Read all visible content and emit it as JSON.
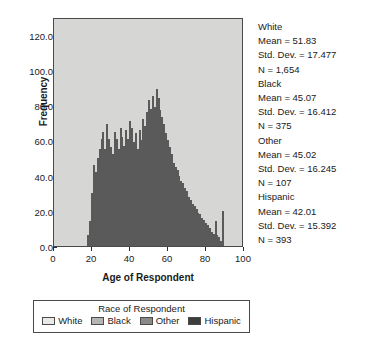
{
  "chart_data": {
    "type": "bar",
    "title": "",
    "xlabel": "Age of Respondent",
    "ylabel": "Frequency",
    "xlim": [
      0,
      100
    ],
    "ylim": [
      0,
      130
    ],
    "grid": false,
    "stacked": true,
    "legend_position": "bottom",
    "legend_title": "Race of Respondent",
    "xticks": [
      0,
      20,
      40,
      60,
      80,
      100
    ],
    "xtick_labels": [
      "0",
      "20",
      "40",
      "60",
      "80",
      "100"
    ],
    "yticks": [
      0,
      20,
      40,
      60,
      80,
      100,
      120
    ],
    "ytick_labels": [
      "0.0",
      "20.0",
      "40.0",
      "60.0",
      "80.0",
      "100.0",
      "120.0"
    ],
    "categories": [
      18,
      19,
      20,
      21,
      22,
      23,
      24,
      25,
      26,
      27,
      28,
      29,
      30,
      31,
      32,
      33,
      34,
      35,
      36,
      37,
      38,
      39,
      40,
      41,
      42,
      43,
      44,
      45,
      46,
      47,
      48,
      49,
      50,
      51,
      52,
      53,
      54,
      55,
      56,
      57,
      58,
      59,
      60,
      61,
      62,
      63,
      64,
      65,
      66,
      67,
      68,
      69,
      70,
      71,
      72,
      73,
      74,
      75,
      76,
      77,
      78,
      79,
      80,
      81,
      82,
      83,
      84,
      85,
      86,
      87,
      88,
      89
    ],
    "series": [
      {
        "name": "White",
        "color": "#e8e8e6",
        "values": [
          2,
          6,
          14,
          22,
          20,
          24,
          26,
          30,
          32,
          27,
          34,
          30,
          28,
          26,
          32,
          30,
          27,
          34,
          31,
          29,
          33,
          30,
          36,
          34,
          30,
          32,
          28,
          34,
          31,
          38,
          36,
          40,
          44,
          42,
          46,
          43,
          48,
          45,
          42,
          40,
          38,
          36,
          34,
          32,
          30,
          28,
          27,
          26,
          24,
          23,
          22,
          21,
          20,
          18,
          17,
          16,
          15,
          14,
          13,
          12,
          11,
          10,
          9,
          8,
          7,
          6,
          5,
          9,
          4,
          3,
          2,
          14
        ]
      },
      {
        "name": "Black",
        "color": "#b4b4b2",
        "values": [
          1,
          3,
          6,
          9,
          8,
          10,
          11,
          12,
          13,
          11,
          14,
          12,
          11,
          10,
          13,
          12,
          11,
          13,
          12,
          11,
          13,
          12,
          14,
          13,
          12,
          13,
          11,
          13,
          12,
          14,
          13,
          15,
          16,
          15,
          16,
          15,
          17,
          16,
          15,
          14,
          13,
          12,
          11,
          10,
          9,
          8,
          8,
          7,
          7,
          6,
          6,
          5,
          5,
          5,
          4,
          4,
          4,
          3,
          3,
          3,
          2,
          2,
          2,
          2,
          1,
          1,
          1,
          2,
          1,
          1,
          1,
          3
        ]
      },
      {
        "name": "Other",
        "color": "#8a8a88",
        "values": [
          1,
          1,
          2,
          3,
          3,
          3,
          4,
          4,
          4,
          3,
          4,
          4,
          3,
          3,
          4,
          4,
          3,
          4,
          4,
          3,
          4,
          4,
          4,
          4,
          3,
          4,
          3,
          4,
          3,
          4,
          4,
          4,
          5,
          4,
          5,
          4,
          5,
          5,
          4,
          4,
          4,
          3,
          3,
          3,
          3,
          2,
          2,
          2,
          2,
          2,
          2,
          2,
          1,
          1,
          1,
          1,
          1,
          1,
          1,
          1,
          1,
          1,
          1,
          1,
          1,
          0,
          0,
          1,
          0,
          0,
          0,
          1
        ]
      },
      {
        "name": "Hispanic",
        "color": "#3d3d3b",
        "values": [
          2,
          4,
          8,
          12,
          11,
          13,
          14,
          15,
          16,
          14,
          17,
          15,
          14,
          13,
          16,
          15,
          14,
          16,
          15,
          14,
          16,
          15,
          17,
          16,
          14,
          15,
          13,
          15,
          14,
          16,
          15,
          17,
          18,
          17,
          18,
          17,
          19,
          18,
          16,
          15,
          14,
          13,
          12,
          11,
          10,
          9,
          8,
          8,
          7,
          6,
          6,
          5,
          5,
          4,
          4,
          3,
          3,
          3,
          2,
          2,
          2,
          2,
          1,
          1,
          1,
          1,
          1,
          2,
          1,
          1,
          0,
          2
        ]
      }
    ]
  },
  "axes": {
    "y_title": "Frequency",
    "x_title": "Age of Respondent"
  },
  "legend": {
    "title": "Race of Respondent",
    "items": [
      {
        "label": "White",
        "color": "#e8e8e6"
      },
      {
        "label": "Black",
        "color": "#b4b4b2"
      },
      {
        "label": "Other",
        "color": "#8a8a88"
      },
      {
        "label": "Hispanic",
        "color": "#3d3d3b"
      }
    ]
  },
  "stats": {
    "groups": [
      {
        "name": "White",
        "mean": "Mean = 51.83",
        "std_dev": "Std. Dev. = 17.477",
        "n": "N = 1,654"
      },
      {
        "name": "Black",
        "mean": "Mean = 45.07",
        "std_dev": "Std. Dev. = 16.412",
        "n": "N = 375"
      },
      {
        "name": "Other",
        "mean": "Mean = 45.02",
        "std_dev": "Std. Dev. = 16.245",
        "n": "N = 107"
      },
      {
        "name": "Hispanic",
        "mean": "Mean = 42.01",
        "std_dev": "Std. Dev. = 15.392",
        "n": "N = 393"
      }
    ]
  },
  "colors": {
    "plot_background": "#d6d6d4",
    "frame": "#4a4a4a",
    "text": "#1a1a1a"
  }
}
